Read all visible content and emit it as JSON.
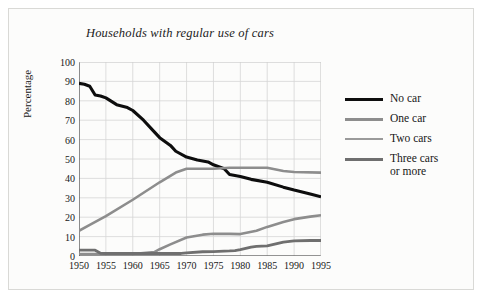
{
  "figure": {
    "title": "Households with regular use of cars",
    "background": "#fcfcfb",
    "frame_color": "#d9d9d6"
  },
  "chart_data": {
    "type": "line",
    "title": "Households with regular use of cars",
    "xlabel": "",
    "ylabel": "Percentage",
    "xlim": [
      1950,
      1995
    ],
    "ylim": [
      0,
      100
    ],
    "grid": true,
    "legend_position": "right",
    "x": [
      1950,
      1955,
      1960,
      1965,
      1970,
      1975,
      1980,
      1985,
      1990,
      1995
    ],
    "xticks": [
      "1950",
      "1955",
      "1960",
      "1965",
      "1970",
      "1975",
      "1980",
      "1985",
      "1990",
      "1995"
    ],
    "yticks": [
      "0",
      "10",
      "20",
      "30",
      "40",
      "50",
      "60",
      "70",
      "80",
      "90",
      "100"
    ],
    "series": [
      {
        "name": "No car",
        "color": "#0d0d0d",
        "width": 3.1,
        "values": [
          89,
          81.5,
          75,
          61,
          51,
          47,
          41,
          38,
          34,
          30.5
        ],
        "points": [
          [
            1950,
            89
          ],
          [
            1951,
            88.5
          ],
          [
            1952,
            87.5
          ],
          [
            1953,
            83
          ],
          [
            1954,
            82.5
          ],
          [
            1955,
            81.5
          ],
          [
            1957,
            78
          ],
          [
            1959,
            76.5
          ],
          [
            1960,
            75
          ],
          [
            1962,
            70
          ],
          [
            1964,
            64
          ],
          [
            1965,
            61
          ],
          [
            1967,
            57
          ],
          [
            1968,
            54
          ],
          [
            1970,
            51
          ],
          [
            1972,
            49.5
          ],
          [
            1974,
            48.5
          ],
          [
            1975,
            47
          ],
          [
            1977,
            45
          ],
          [
            1978,
            42
          ],
          [
            1980,
            41
          ],
          [
            1982,
            39.5
          ],
          [
            1985,
            38
          ],
          [
            1988,
            35.5
          ],
          [
            1990,
            34
          ],
          [
            1993,
            32
          ],
          [
            1995,
            30.5
          ]
        ]
      },
      {
        "name": "One car",
        "color": "#8d8d8d",
        "width": 2.6,
        "values": [
          13,
          20,
          29,
          38,
          45,
          45,
          45.5,
          45.5,
          43.5,
          43
        ],
        "points": [
          [
            1950,
            13
          ],
          [
            1952,
            16
          ],
          [
            1955,
            20.5
          ],
          [
            1960,
            29
          ],
          [
            1965,
            38
          ],
          [
            1968,
            43
          ],
          [
            1970,
            45
          ],
          [
            1973,
            45
          ],
          [
            1975,
            45
          ],
          [
            1978,
            45.5
          ],
          [
            1980,
            45.5
          ],
          [
            1983,
            45.5
          ],
          [
            1985,
            45.5
          ],
          [
            1988,
            43.8
          ],
          [
            1990,
            43.3
          ],
          [
            1995,
            43
          ]
        ]
      },
      {
        "name": "Two cars",
        "color": "#8d8d8d",
        "width": 2.6,
        "values": [
          1,
          1,
          1,
          3.5,
          9.5,
          11.5,
          11.3,
          15,
          19,
          21
        ],
        "points": [
          [
            1950,
            1
          ],
          [
            1955,
            1
          ],
          [
            1960,
            1
          ],
          [
            1964,
            2
          ],
          [
            1965,
            3.5
          ],
          [
            1967,
            6
          ],
          [
            1970,
            9.5
          ],
          [
            1973,
            11
          ],
          [
            1975,
            11.5
          ],
          [
            1978,
            11.4
          ],
          [
            1980,
            11.3
          ],
          [
            1983,
            13
          ],
          [
            1985,
            15
          ],
          [
            1988,
            17.5
          ],
          [
            1990,
            19
          ],
          [
            1993,
            20.3
          ],
          [
            1995,
            21
          ]
        ]
      },
      {
        "name": "Three cars\nor more",
        "color": "#6f6f6f",
        "width": 2.8,
        "values": [
          3,
          2.5,
          1.3,
          1.3,
          1.5,
          2.3,
          2.8,
          5.2,
          7.8,
          8
        ],
        "points": [
          [
            1950,
            3
          ],
          [
            1953,
            3
          ],
          [
            1954,
            1.4
          ],
          [
            1955,
            1.3
          ],
          [
            1960,
            1.3
          ],
          [
            1965,
            1.3
          ],
          [
            1969,
            1.3
          ],
          [
            1970,
            1.6
          ],
          [
            1973,
            2.2
          ],
          [
            1975,
            2.3
          ],
          [
            1978,
            2.6
          ],
          [
            1979,
            2.8
          ],
          [
            1980,
            3.3
          ],
          [
            1982,
            4.6
          ],
          [
            1983,
            5.0
          ],
          [
            1985,
            5.2
          ],
          [
            1988,
            7.2
          ],
          [
            1990,
            7.8
          ],
          [
            1993,
            8.0
          ],
          [
            1995,
            8.0
          ]
        ]
      }
    ]
  },
  "axes": {
    "y_title": "Percentage"
  },
  "legend": {
    "entries": [
      {
        "label": "No car",
        "color": "#0d0d0d",
        "thickness": 3.4
      },
      {
        "label": "One car",
        "color": "#8d8d8d",
        "thickness": 2.6
      },
      {
        "label": "Two cars",
        "color": "#9a9a9a",
        "thickness": 2.4
      },
      {
        "label": "Three cars\nor more",
        "color": "#6f6f6f",
        "thickness": 3.0
      }
    ]
  }
}
